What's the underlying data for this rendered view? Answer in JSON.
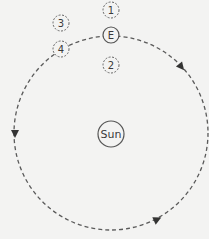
{
  "diagram": {
    "type": "orbit",
    "orbit": {
      "direction": "clockwise",
      "style": "dashed"
    },
    "center_body": {
      "label": "Sun"
    },
    "earth": {
      "label": "E"
    },
    "positions": [
      {
        "label": "1"
      },
      {
        "label": "2"
      },
      {
        "label": "3"
      },
      {
        "label": "4"
      }
    ],
    "colors": {
      "background": "#f3f3f2",
      "line": "#555555",
      "text": "#3a3a3a"
    }
  }
}
